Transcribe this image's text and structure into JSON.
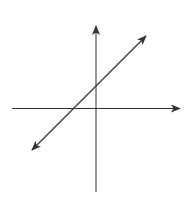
{
  "diagram": {
    "colors": {
      "background": "#ffffff",
      "axis": "#333333",
      "line": "#3a3a3a"
    },
    "axes": {
      "x_axis": {
        "arrow": "right"
      },
      "y_axis": {
        "arrow": "up"
      }
    },
    "line": {
      "slope_sign": "positive",
      "y_intercept_sign": "positive",
      "x_intercept_sign": "negative",
      "arrows": "both-ends"
    }
  }
}
